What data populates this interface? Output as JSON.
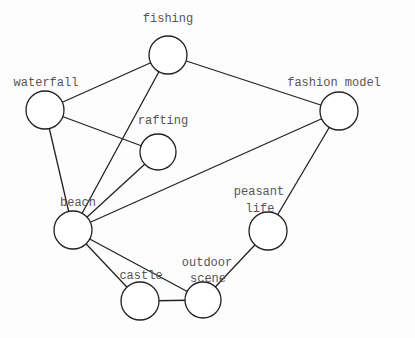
{
  "diagram": {
    "type": "undirected-graph",
    "nodes": [
      {
        "id": "fishing",
        "lines": [
          "fishing"
        ],
        "x": 168,
        "y": 55,
        "r": 19
      },
      {
        "id": "waterfall",
        "lines": [
          "waterfall"
        ],
        "x": 45,
        "y": 110,
        "r": 19
      },
      {
        "id": "rafting",
        "lines": [
          "rafting"
        ],
        "x": 158,
        "y": 152,
        "r": 18
      },
      {
        "id": "fashion model",
        "lines": [
          "fashion model"
        ],
        "x": 339,
        "y": 111,
        "r": 19
      },
      {
        "id": "beach",
        "lines": [
          "beach"
        ],
        "x": 73,
        "y": 230,
        "r": 19
      },
      {
        "id": "peasant life",
        "lines": [
          "peasant",
          "life"
        ],
        "x": 268,
        "y": 231,
        "r": 19
      },
      {
        "id": "castle",
        "lines": [
          "castle"
        ],
        "x": 140,
        "y": 301,
        "r": 19
      },
      {
        "id": "outdoor scene",
        "lines": [
          "outdoor",
          "scene"
        ],
        "x": 203,
        "y": 300,
        "r": 18
      }
    ],
    "edges": [
      [
        "fishing",
        "waterfall"
      ],
      [
        "fishing",
        "fashion model"
      ],
      [
        "fishing",
        "beach"
      ],
      [
        "waterfall",
        "rafting"
      ],
      [
        "waterfall",
        "beach"
      ],
      [
        "rafting",
        "beach"
      ],
      [
        "fashion model",
        "beach"
      ],
      [
        "fashion model",
        "peasant life"
      ],
      [
        "beach",
        "castle"
      ],
      [
        "beach",
        "outdoor scene"
      ],
      [
        "castle",
        "outdoor scene"
      ],
      [
        "outdoor scene",
        "peasant life"
      ]
    ]
  },
  "labels": {
    "fishing": "fishing",
    "waterfall": "waterfall",
    "rafting": "rafting",
    "fashion_model": "fashion model",
    "beach": "beach",
    "peasant_life_1": "peasant",
    "peasant_life_2": "life",
    "castle": "castle",
    "outdoor_scene_1": "outdoor",
    "outdoor_scene_2": "scene"
  }
}
